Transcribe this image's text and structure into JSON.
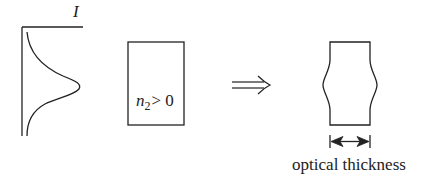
{
  "diagram": {
    "intensity_profile": {
      "axis_label": "I",
      "shape": "gaussian"
    },
    "medium": {
      "label_var": "n",
      "label_sub": "2",
      "label_rel": "> 0"
    },
    "implies_arrow": "⟹",
    "result_medium": {
      "caption": "optical thickness",
      "dimension_arrow": "double-headed"
    },
    "colors": {
      "stroke": "#222222",
      "background": "#ffffff"
    }
  }
}
